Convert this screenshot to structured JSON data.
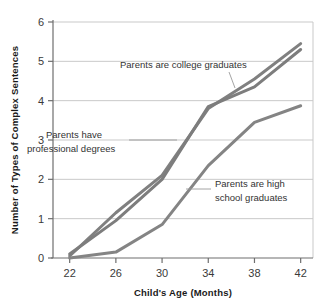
{
  "chart_data": {
    "type": "line",
    "title": "",
    "subtitle": "",
    "xlabel": "Child's Age (Months)",
    "ylabel": "Number of Types of Complex Sentences",
    "x": [
      22,
      26,
      30,
      34,
      38,
      42
    ],
    "xtick_labels": [
      "22",
      "26",
      "30",
      "34",
      "38",
      "42"
    ],
    "ytick_labels": [
      "0",
      "1",
      "2",
      "3",
      "4",
      "5",
      "6"
    ],
    "xlim": [
      20,
      44
    ],
    "ylim": [
      0,
      6
    ],
    "grid": "horizontal",
    "legend": "none",
    "series": [
      {
        "name": "Parents are college graduates",
        "values": [
          0.05,
          1.15,
          2.1,
          3.8,
          4.55,
          5.45
        ],
        "color": "#808080"
      },
      {
        "name": "Parents have professional degrees",
        "values": [
          0.1,
          0.95,
          2.0,
          3.85,
          4.35,
          5.3
        ],
        "color": "#7d7d7d"
      },
      {
        "name": "Parents are high school graduates",
        "values": [
          0.0,
          0.15,
          0.85,
          2.35,
          3.45,
          3.87
        ],
        "color": "#848484"
      }
    ],
    "annotations": [
      {
        "id": "college",
        "lines": [
          "Parents are college graduates"
        ]
      },
      {
        "id": "professional",
        "lines": [
          "Parents have",
          "professional degrees"
        ]
      },
      {
        "id": "highschool",
        "lines": [
          "Parents are high",
          "school graduates"
        ]
      }
    ],
    "colors": {
      "line": "#808080",
      "grid": "#c9c9c9",
      "axis": "#6e6e6e",
      "text": "#333333",
      "background": "#ffffff"
    }
  }
}
